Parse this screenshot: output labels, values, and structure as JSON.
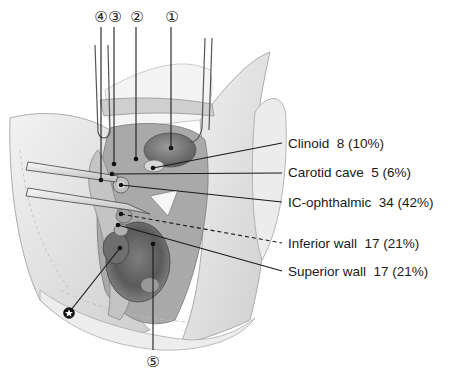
{
  "figure": {
    "type": "anatomical-illustration",
    "colors": {
      "ink": "#1a1a1a",
      "tissue_light": "#e6e6e6",
      "tissue_mid": "#b5b5b5",
      "tissue_dark": "#6e6e6e",
      "background": "#ffffff"
    }
  },
  "top_markers": [
    {
      "id": "4",
      "glyph": "④",
      "x": 101,
      "y": 17
    },
    {
      "id": "3",
      "glyph": "③",
      "x": 115,
      "y": 17
    },
    {
      "id": "2",
      "glyph": "②",
      "x": 137,
      "y": 17
    },
    {
      "id": "1",
      "glyph": "①",
      "x": 172,
      "y": 17
    }
  ],
  "bottom_marker": {
    "id": "5",
    "glyph": "⑤",
    "x": 153,
    "y": 362
  },
  "star_marker": {
    "glyph": "✪",
    "x": 69,
    "y": 313
  },
  "labels": [
    {
      "key": "clinoid",
      "name": "Clinoid",
      "count": "8",
      "percent": "(10%)",
      "text": "Clinoid  8 (10%)",
      "y": 143,
      "line_style": "solid"
    },
    {
      "key": "carotid_cave",
      "name": "Carotid cave",
      "count": "5",
      "percent": "(6%)",
      "text": "Carotid cave  5 (6%)",
      "y": 172,
      "line_style": "solid"
    },
    {
      "key": "ic_ophthalmic",
      "name": "IC-ophthalmic",
      "count": "34",
      "percent": "(42%)",
      "text": "IC-ophthalmic  34 (42%)",
      "y": 202,
      "line_style": "solid"
    },
    {
      "key": "inferior_wall",
      "name": "Inferior wall",
      "count": "17",
      "percent": "(21%)",
      "text": "Inferior wall  17 (21%)",
      "y": 243,
      "line_style": "dashed"
    },
    {
      "key": "superior_wall",
      "name": "Superior wall",
      "count": "17",
      "percent": "(21%)",
      "text": "Superior wall  17 (21%)",
      "y": 271,
      "line_style": "solid"
    }
  ]
}
